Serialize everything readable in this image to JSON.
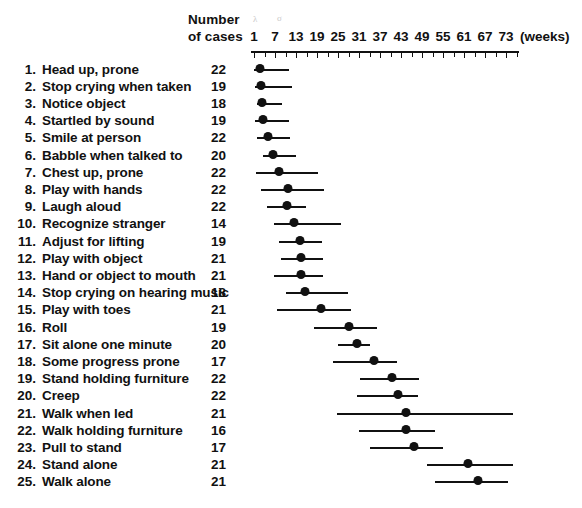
{
  "header": {
    "cases_line1": "Number",
    "cases_line2": "of cases",
    "units_label": "(weeks)",
    "smudge_a": "λ",
    "smudge_b": "σ"
  },
  "axis": {
    "tick_labels": [
      "1",
      "7",
      "13",
      "19",
      "25",
      "31",
      "37",
      "43",
      "49",
      "55",
      "61",
      "67",
      "73"
    ],
    "tick_values": [
      1,
      7,
      13,
      19,
      25,
      31,
      37,
      43,
      49,
      55,
      61,
      67,
      73
    ],
    "min": 1,
    "max": 76,
    "minor_step": 3,
    "units": "weeks",
    "color": "#111111"
  },
  "chart_data": {
    "type": "range-dot",
    "title": "",
    "subtitle": "",
    "xlabel": "(weeks)",
    "ylabel": "",
    "xlim": [
      1,
      76
    ],
    "grid": false,
    "legend": "none",
    "columns": [
      "#",
      "Milestone",
      "Number of cases",
      "Median (weeks)",
      "Range low (weeks)",
      "Range high (weeks)"
    ],
    "rows": [
      {
        "index": "1.",
        "label": "Head up, prone",
        "cases": "22",
        "median": 2.7,
        "low": 1.0,
        "high": 11.0
      },
      {
        "index": "2.",
        "label": "Stop crying when taken",
        "cases": "19",
        "median": 3.0,
        "low": 1.3,
        "high": 11.9
      },
      {
        "index": "3.",
        "label": "Notice object",
        "cases": "18",
        "median": 3.3,
        "low": 1.9,
        "high": 9.0
      },
      {
        "index": "4.",
        "label": "Startled by sound",
        "cases": "19",
        "median": 3.6,
        "low": 1.3,
        "high": 11.0
      },
      {
        "index": "5.",
        "label": "Smile at person",
        "cases": "22",
        "median": 4.9,
        "low": 1.9,
        "high": 11.3
      },
      {
        "index": "6.",
        "label": "Babble when talked to",
        "cases": "20",
        "median": 6.4,
        "low": 3.6,
        "high": 13.0
      },
      {
        "index": "7.",
        "label": "Chest up, prone",
        "cases": "22",
        "median": 8.1,
        "low": 1.6,
        "high": 19.3
      },
      {
        "index": "8.",
        "label": "Play with hands",
        "cases": "22",
        "median": 10.7,
        "low": 3.0,
        "high": 21.0
      },
      {
        "index": "9.",
        "label": "Laugh aloud",
        "cases": "22",
        "median": 10.4,
        "low": 4.7,
        "high": 15.9
      },
      {
        "index": "10.",
        "label": "Recognize stranger",
        "cases": "14",
        "median": 12.4,
        "low": 6.7,
        "high": 26.0
      },
      {
        "index": "11.",
        "label": "Adjust for lifting",
        "cases": "19",
        "median": 14.1,
        "low": 8.1,
        "high": 20.4
      },
      {
        "index": "12.",
        "label": "Play with object",
        "cases": "21",
        "median": 14.4,
        "low": 8.7,
        "high": 20.7
      },
      {
        "index": "13.",
        "label": "Hand or object to mouth",
        "cases": "21",
        "median": 14.4,
        "low": 6.7,
        "high": 20.7
      },
      {
        "index": "14.",
        "label": "Stop crying on hearing music",
        "cases": "18",
        "median": 15.6,
        "low": 10.1,
        "high": 28.0
      },
      {
        "index": "15.",
        "label": "Play with toes",
        "cases": "21",
        "median": 20.0,
        "low": 7.6,
        "high": 28.6
      },
      {
        "index": "16.",
        "label": "Roll",
        "cases": "19",
        "median": 28.1,
        "low": 18.1,
        "high": 36.1
      },
      {
        "index": "17.",
        "label": "Sit alone one minute",
        "cases": "20",
        "median": 30.3,
        "low": 25.1,
        "high": 34.1
      },
      {
        "index": "18.",
        "label": "Some progress prone",
        "cases": "17",
        "median": 35.4,
        "low": 23.7,
        "high": 41.9
      },
      {
        "index": "19.",
        "label": "Stand holding furniture",
        "cases": "22",
        "median": 40.3,
        "low": 31.4,
        "high": 48.1
      },
      {
        "index": "20.",
        "label": "Creep",
        "cases": "22",
        "median": 42.1,
        "low": 30.3,
        "high": 48.0
      },
      {
        "index": "21.",
        "label": "Walk when led",
        "cases": "21",
        "median": 44.4,
        "low": 24.7,
        "high": 74.9
      },
      {
        "index": "22.",
        "label": "Walk holding furniture",
        "cases": "16",
        "median": 44.4,
        "low": 30.9,
        "high": 52.7
      },
      {
        "index": "23.",
        "label": "Pull to stand",
        "cases": "17",
        "median": 46.6,
        "low": 34.1,
        "high": 55.0
      },
      {
        "index": "24.",
        "label": "Stand alone",
        "cases": "21",
        "median": 62.0,
        "low": 50.3,
        "high": 75.1
      },
      {
        "index": "25.",
        "label": "Walk alone",
        "cases": "21",
        "median": 64.9,
        "low": 52.6,
        "high": 73.7
      }
    ]
  }
}
